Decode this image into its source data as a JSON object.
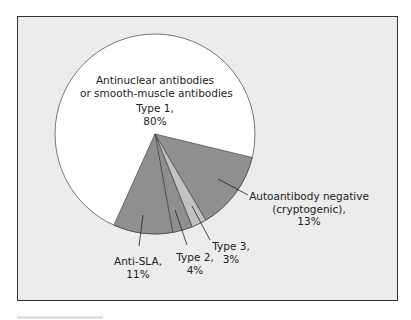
{
  "chart_data": {
    "type": "pie",
    "title": "",
    "slices": [
      {
        "label": "Antinuclear antibodies or smooth-muscle antibodies Type 1",
        "value": 80,
        "color": "#ffffff"
      },
      {
        "label": "Autoantibody negative (cryptogenic)",
        "value": 13,
        "color": "#8f8f8f"
      },
      {
        "label": "Type 3",
        "value": 3,
        "color": "#c2c2c2"
      },
      {
        "label": "Type 2",
        "value": 4,
        "color": "#8f8f8f"
      },
      {
        "label": "Anti-SLA",
        "value": 11,
        "color": "#8f8f8f"
      }
    ],
    "note": "Slices are drawn as an exploded-style fan from a central apex; percentages as labeled."
  },
  "labels": {
    "type1_line1": "Antinuclear antibodies",
    "type1_line2": "or smooth-muscle antibodies",
    "type1_line3": "Type 1,",
    "type1_line4": "80%",
    "autoneg_line1": "Autoantibody negative",
    "autoneg_line2": "(cryptogenic),",
    "autoneg_line3": "13%",
    "type3_line1": "Type 3,",
    "type3_line2": "3%",
    "type2_line1": "Type 2,",
    "type2_line2": "4%",
    "antisla_line1": "Anti-SLA,",
    "antisla_line2": "11%"
  },
  "geometry": {
    "cx": 155,
    "cy": 134,
    "r": 100,
    "boundaries_deg": [
      13.6,
      59.5,
      68.2,
      79.8,
      114.3
    ]
  }
}
